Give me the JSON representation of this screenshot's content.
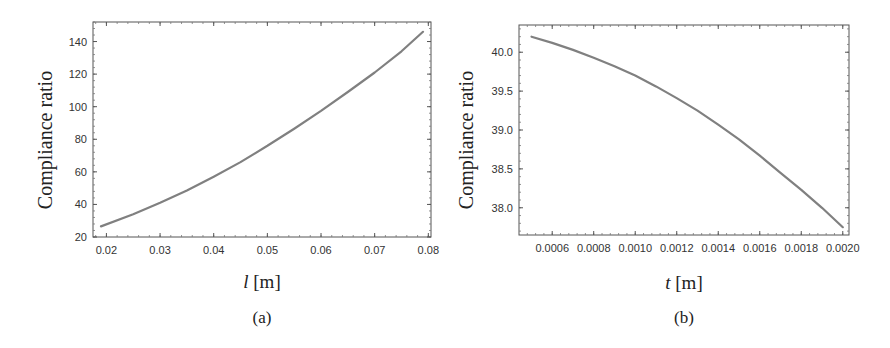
{
  "chart_data": [
    {
      "id": "a",
      "type": "line",
      "caption": "(a)",
      "title": "",
      "xlabel_var": "l",
      "xlabel_unit": "[m]",
      "ylabel": "Compliance ratio",
      "xlim": [
        0.0175,
        0.0805
      ],
      "ylim": [
        20,
        152
      ],
      "xticks": [
        "0.02",
        "0.03",
        "0.04",
        "0.05",
        "0.06",
        "0.07",
        "0.08"
      ],
      "xtick_values": [
        0.02,
        0.03,
        0.04,
        0.05,
        0.06,
        0.07,
        0.08
      ],
      "yticks": [
        "20",
        "40",
        "60",
        "80",
        "100",
        "120",
        "140"
      ],
      "ytick_values": [
        20,
        40,
        60,
        80,
        100,
        120,
        140
      ],
      "grid": false,
      "series": [
        {
          "name": "Compliance ratio vs l",
          "color": "#808080",
          "x": [
            0.019,
            0.025,
            0.03,
            0.035,
            0.04,
            0.045,
            0.05,
            0.055,
            0.06,
            0.065,
            0.07,
            0.075,
            0.079
          ],
          "y": [
            26.5,
            34,
            41,
            48.5,
            57,
            66,
            76,
            86.5,
            97.5,
            109,
            121,
            134,
            146
          ]
        }
      ]
    },
    {
      "id": "b",
      "type": "line",
      "caption": "(b)",
      "title": "",
      "xlabel_var": "t",
      "xlabel_unit": "[m]",
      "ylabel": "Compliance ratio",
      "xlim": [
        0.00044,
        0.00203
      ],
      "ylim": [
        37.65,
        40.35
      ],
      "xticks": [
        "0.0006",
        "0.0008",
        "0.0010",
        "0.0012",
        "0.0014",
        "0.0016",
        "0.0018",
        "0.0020"
      ],
      "xtick_values": [
        0.0006,
        0.0008,
        0.001,
        0.0012,
        0.0014,
        0.0016,
        0.0018,
        0.002
      ],
      "yticks": [
        "38.0",
        "38.5",
        "39.0",
        "39.5",
        "40.0"
      ],
      "ytick_values": [
        38.0,
        38.5,
        39.0,
        39.5,
        40.0
      ],
      "grid": false,
      "series": [
        {
          "name": "Compliance ratio vs t",
          "color": "#808080",
          "x": [
            0.0005,
            0.0006,
            0.0007,
            0.0008,
            0.0009,
            0.001,
            0.0011,
            0.0012,
            0.0013,
            0.0014,
            0.0015,
            0.0016,
            0.0017,
            0.0018,
            0.0019,
            0.002
          ],
          "y": [
            40.2,
            40.12,
            40.03,
            39.93,
            39.82,
            39.7,
            39.56,
            39.41,
            39.25,
            39.07,
            38.88,
            38.67,
            38.45,
            38.23,
            38.0,
            37.75
          ]
        }
      ]
    }
  ]
}
